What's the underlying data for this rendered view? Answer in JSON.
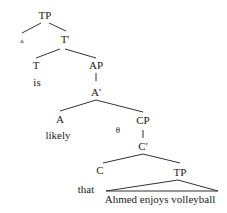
{
  "diagram": {
    "type": "syntax-tree",
    "nodes": {
      "tp_root": "TP",
      "spec_tp": "▲",
      "t_bar": "T'",
      "t_head": "T",
      "t_word": "is",
      "ap": "AP",
      "a_bar": "A'",
      "a_head": "A",
      "a_word": "likely",
      "theta": "θ",
      "cp": "CP",
      "c_bar": "C'",
      "c_head": "C",
      "c_word": "that",
      "tp_embedded": "TP",
      "tp_embedded_words": "Ahmed enjoys volleyball"
    },
    "colors": {
      "line": "#333333",
      "text": "#222222",
      "faint": "#9a9a9a"
    }
  }
}
